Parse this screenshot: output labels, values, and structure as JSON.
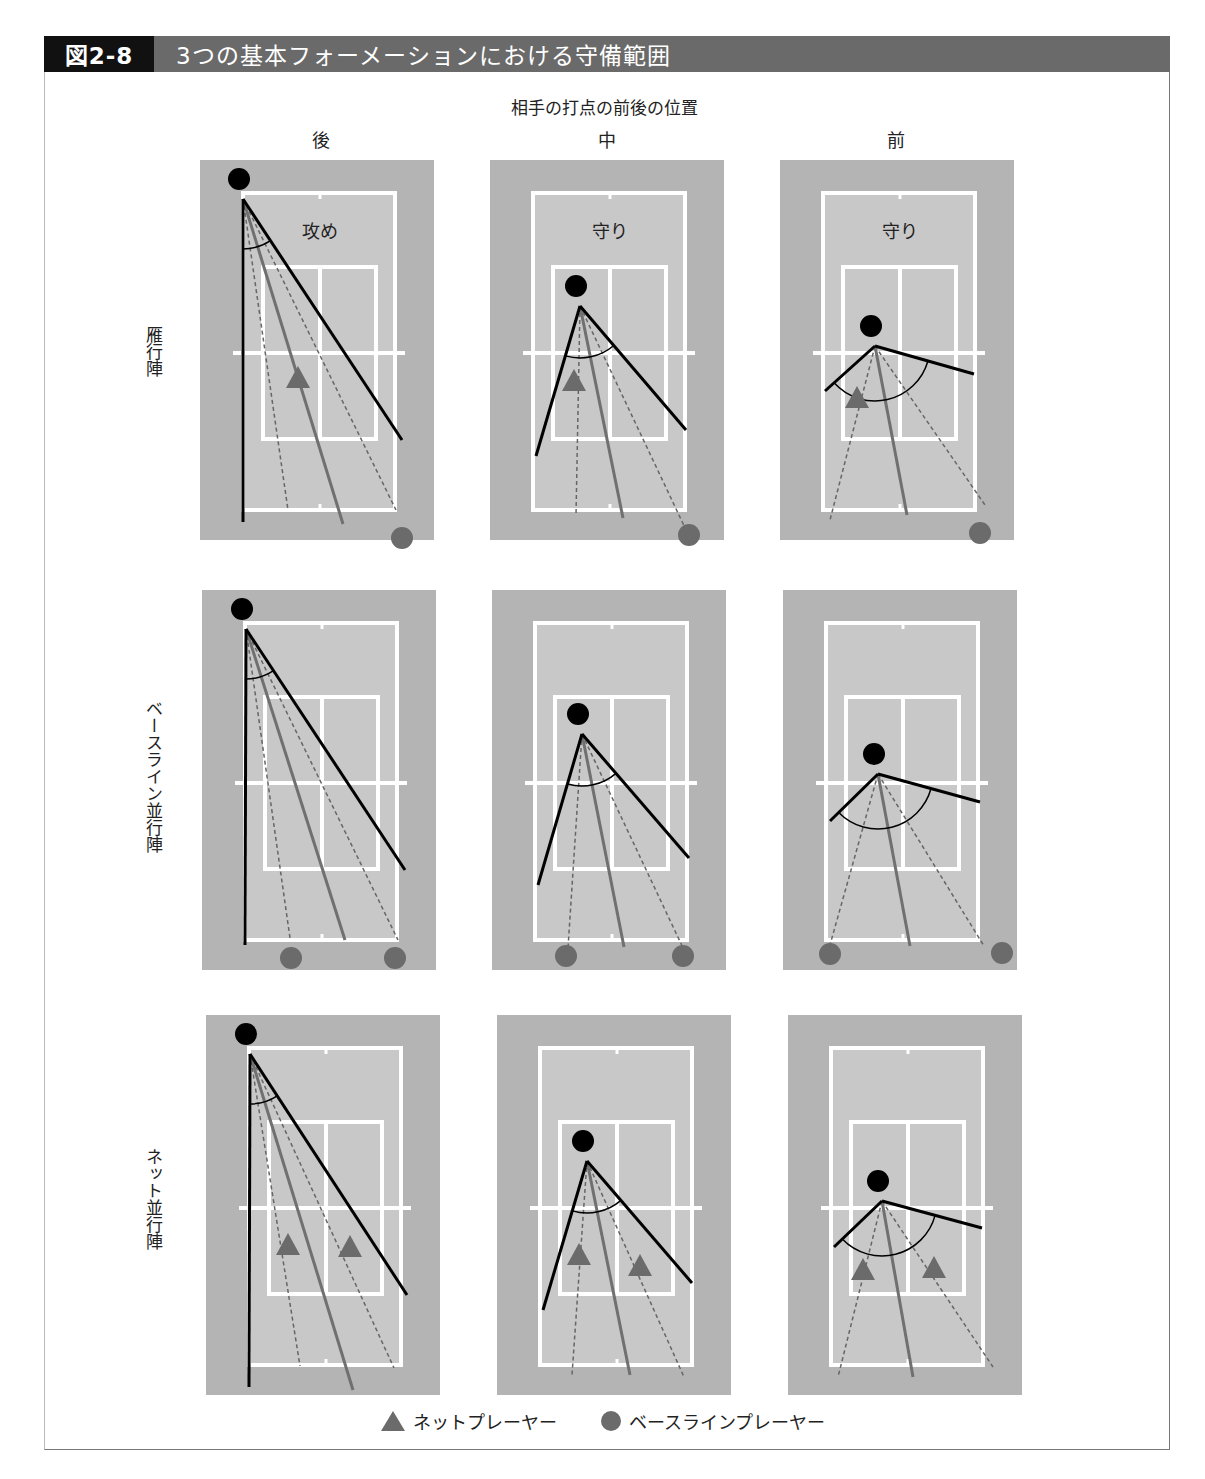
{
  "figure": {
    "number": "図2-8",
    "title": "3つの基本フォーメーションにおける守備範囲"
  },
  "axis_title": "相手の打点の前後の位置",
  "columns": [
    "後",
    "中",
    "前"
  ],
  "rows": [
    "雁行陣",
    "ベースライン並行陣",
    "ネット並行陣"
  ],
  "panel_labels": {
    "row0_col0": "攻め",
    "row0_col1": "守り",
    "row0_col2": "守り"
  },
  "legend": {
    "net_player": "ネットプレーヤー",
    "baseline_player": "ベースラインプレーヤー"
  },
  "colors": {
    "outer_court": "#b4b4b4",
    "inner_court": "#c8c8c8",
    "court_lines": "#ffffff",
    "hitter": "#000000",
    "player": "#6b6b6b",
    "title_bar": "#6a6a6a",
    "figure_no_bg": "#111111"
  },
  "panels": [
    {
      "row": 0,
      "col": 0,
      "x": 200,
      "y": 160,
      "hitter": [
        39,
        19
      ],
      "range_lines": [
        [
          43,
          362
        ],
        [
          202,
          280
        ]
      ],
      "center_line": [
        143,
        364
      ],
      "dashed": [
        [
          88,
          350
        ],
        [
          196,
          350
        ]
      ],
      "arc_r": 50,
      "triangles": [
        [
          98,
          218
        ]
      ],
      "circles": [
        [
          202,
          378
        ]
      ]
    },
    {
      "row": 0,
      "col": 1,
      "x": 490,
      "y": 160,
      "hitter": [
        86,
        126
      ],
      "range_lines": [
        [
          46,
          296
        ],
        [
          196,
          270
        ]
      ],
      "center_line": [
        133,
        358
      ],
      "dashed": [
        [
          86,
          355
        ],
        [
          197,
          372
        ]
      ],
      "arc_r": 52,
      "triangles": [
        [
          84,
          221
        ]
      ],
      "circles": [
        [
          199,
          375
        ]
      ]
    },
    {
      "row": 0,
      "col": 2,
      "x": 780,
      "y": 160,
      "hitter": [
        91,
        166
      ],
      "range_lines": [
        [
          45,
          231
        ],
        [
          194,
          214
        ]
      ],
      "center_line": [
        127,
        355
      ],
      "dashed": [
        [
          50,
          360
        ],
        [
          205,
          345
        ]
      ],
      "arc_r": 55,
      "triangles": [
        [
          77,
          238
        ]
      ],
      "circles": [
        [
          200,
          373
        ]
      ]
    },
    {
      "row": 1,
      "col": 0,
      "x": 202,
      "y": 590,
      "hitter": [
        40,
        19
      ],
      "range_lines": [
        [
          43,
          355
        ],
        [
          203,
          280
        ]
      ],
      "center_line": [
        143,
        350
      ],
      "dashed": [
        [
          88,
          348
        ],
        [
          196,
          350
        ]
      ],
      "arc_r": 50,
      "triangles": [],
      "circles": [
        [
          89,
          368
        ],
        [
          193,
          368
        ]
      ]
    },
    {
      "row": 1,
      "col": 1,
      "x": 492,
      "y": 590,
      "hitter": [
        86,
        124
      ],
      "range_lines": [
        [
          46,
          295
        ],
        [
          197,
          268
        ]
      ],
      "center_line": [
        132,
        357
      ],
      "dashed": [
        [
          76,
          358
        ],
        [
          192,
          360
        ]
      ],
      "arc_r": 52,
      "triangles": [],
      "circles": [
        [
          74,
          366
        ],
        [
          191,
          366
        ]
      ]
    },
    {
      "row": 1,
      "col": 2,
      "x": 783,
      "y": 590,
      "hitter": [
        91,
        164
      ],
      "range_lines": [
        [
          47,
          231
        ],
        [
          197,
          212
        ]
      ],
      "center_line": [
        127,
        356
      ],
      "dashed": [
        [
          45,
          362
        ],
        [
          201,
          356
        ]
      ],
      "arc_r": 55,
      "triangles": [],
      "circles": [
        [
          47,
          364
        ],
        [
          219,
          363
        ]
      ]
    },
    {
      "row": 2,
      "col": 0,
      "x": 206,
      "y": 1015,
      "hitter": [
        40,
        19
      ],
      "range_lines": [
        [
          43,
          372
        ],
        [
          201,
          280
        ]
      ],
      "center_line": [
        147,
        375
      ],
      "dashed": [
        [
          94,
          351
        ],
        [
          188,
          353
        ]
      ],
      "arc_r": 50,
      "triangles": [
        [
          82,
          230
        ],
        [
          144,
          232
        ]
      ],
      "circles": []
    },
    {
      "row": 2,
      "col": 1,
      "x": 497,
      "y": 1015,
      "hitter": [
        86,
        126
      ],
      "range_lines": [
        [
          46,
          295
        ],
        [
          195,
          268
        ]
      ],
      "center_line": [
        133,
        360
      ],
      "dashed": [
        [
          75,
          360
        ],
        [
          187,
          362
        ]
      ],
      "arc_r": 52,
      "triangles": [
        [
          82,
          240
        ],
        [
          143,
          251
        ]
      ],
      "circles": []
    },
    {
      "row": 2,
      "col": 2,
      "x": 788,
      "y": 1015,
      "hitter": [
        90,
        166
      ],
      "range_lines": [
        [
          46,
          232
        ],
        [
          194,
          213
        ]
      ],
      "center_line": [
        125,
        362
      ],
      "dashed": [
        [
          50,
          362
        ],
        [
          205,
          352
        ]
      ],
      "arc_r": 55,
      "triangles": [
        [
          75,
          255
        ],
        [
          146,
          253
        ]
      ],
      "circles": []
    }
  ]
}
